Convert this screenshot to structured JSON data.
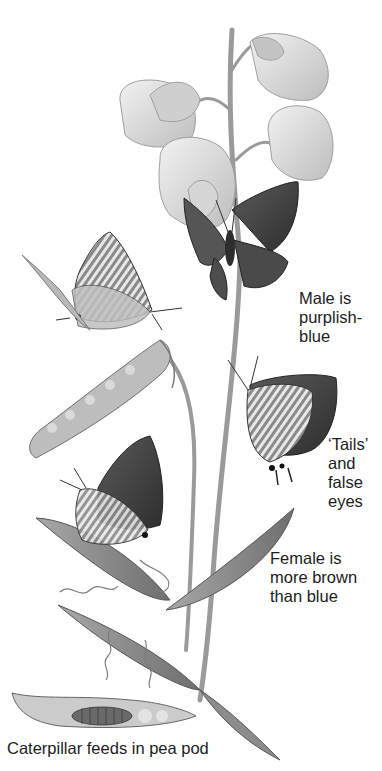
{
  "figure": {
    "palette": {
      "background": "#ffffff",
      "ink": "#1c1c1c",
      "petal": "#e6e6e6",
      "petal_shade": "#bdbdbd",
      "stem": "#9a9a9a",
      "leaf": "#8c8c8c",
      "wing_dark": "#3a3a3a",
      "wing_mid": "#6b6b6b",
      "pod": "#b4b4b4"
    }
  },
  "labels": {
    "male": {
      "lines": [
        "Male is",
        "purplish-",
        "blue"
      ]
    },
    "tails": {
      "lines": [
        "‘Tails’",
        "and",
        "false",
        "eyes"
      ]
    },
    "female": {
      "lines": [
        "Female is",
        "more brown",
        "than blue"
      ]
    },
    "caterpillar": {
      "text": "Caterpillar feeds in pea pod"
    }
  },
  "elements": [
    {
      "name": "sweet-pea-flowers",
      "description": "Cluster of pale pea flowers at top"
    },
    {
      "name": "male-butterfly",
      "description": "Dark wings open, on flower"
    },
    {
      "name": "underside-butterfly-upper",
      "description": "Striped underside, on pea pod"
    },
    {
      "name": "pea-pod",
      "description": "Long open pea pod with seeds"
    },
    {
      "name": "tailed-butterfly",
      "description": "Underside with tails and false eyes, on stem"
    },
    {
      "name": "female-butterfly",
      "description": "Brownish wings, on leaf"
    },
    {
      "name": "leaves-and-tendrils",
      "description": "Long leaves with curling tendrils"
    },
    {
      "name": "caterpillar-pod",
      "description": "Opened pod with caterpillar inside"
    }
  ]
}
